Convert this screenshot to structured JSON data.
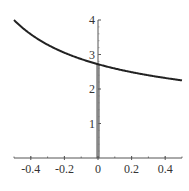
{
  "chart_data": {
    "type": "line",
    "title": "",
    "xlabel": "",
    "ylabel": "",
    "xlim": [
      -0.5,
      0.5
    ],
    "ylim": [
      0,
      4
    ],
    "grid": false,
    "legend": null,
    "function": "(1+x)^(1/x)",
    "x_ticks": [
      -0.4,
      -0.2,
      0,
      0.2,
      0.4
    ],
    "x_tick_labels": [
      "-0.4",
      "-0.2",
      "0",
      "0.2",
      "0.4"
    ],
    "y_ticks": [
      1,
      2,
      3,
      4
    ],
    "y_tick_labels": [
      "1",
      "2",
      "3",
      "4"
    ],
    "series": [
      {
        "name": "curve",
        "color": "#222222",
        "x": [
          -0.5,
          -0.45,
          -0.4,
          -0.35,
          -0.3,
          -0.25,
          -0.2,
          -0.15,
          -0.1,
          -0.05,
          -0.01,
          0.01,
          0.05,
          0.1,
          0.15,
          0.2,
          0.25,
          0.3,
          0.35,
          0.4,
          0.45,
          0.5
        ],
        "y": [
          4.0,
          3.77,
          3.45,
          3.29,
          3.28,
          3.16,
          3.05,
          2.96,
          2.87,
          2.79,
          2.73,
          2.7,
          2.65,
          2.59,
          2.54,
          2.49,
          2.44,
          2.4,
          2.36,
          2.32,
          2.29,
          2.25
        ]
      }
    ],
    "annotations": [
      {
        "type": "shaded-bar",
        "x_range": [
          -0.01,
          0.01
        ],
        "y_range": [
          0,
          2.718
        ],
        "color": "#bbbbbb",
        "label": ""
      }
    ]
  }
}
